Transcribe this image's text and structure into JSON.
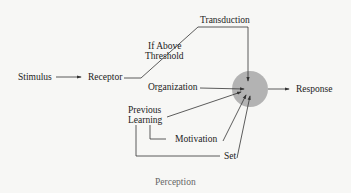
{
  "diagram": {
    "caption": "Perception",
    "nodes": {
      "stimulus": "Stimulus",
      "receptor": "Receptor",
      "threshold_line1": "If Above",
      "threshold_line2": "Threshold",
      "transduction": "Transduction",
      "organization": "Organization",
      "previous_line1": "Previous",
      "previous_line2": "Learning",
      "motivation": "Motivation",
      "set": "Set",
      "response": "Response"
    },
    "colors": {
      "circle": "#b3b3b3",
      "line": "#333333"
    }
  }
}
